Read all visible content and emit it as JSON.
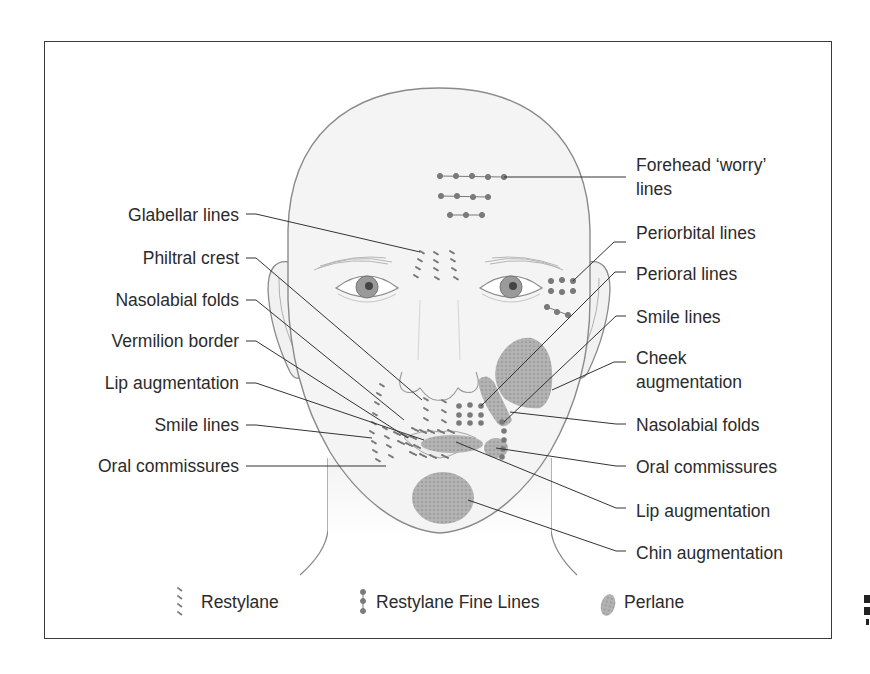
{
  "figure": {
    "left_labels": [
      {
        "id": "glabellar",
        "text": "Glabellar lines"
      },
      {
        "id": "philtral",
        "text": "Philtral crest"
      },
      {
        "id": "nasolabial-left",
        "text": "Nasolabial folds"
      },
      {
        "id": "vermilion",
        "text": "Vermilion border"
      },
      {
        "id": "lip-left",
        "text": "Lip augmentation"
      },
      {
        "id": "smile-left",
        "text": "Smile lines"
      },
      {
        "id": "oral-left",
        "text": "Oral commissures"
      }
    ],
    "right_labels": [
      {
        "id": "forehead",
        "line1": "Forehead ‘worry’",
        "line2": "lines"
      },
      {
        "id": "periorbital",
        "line1": "Periorbital lines"
      },
      {
        "id": "perioral",
        "line1": "Perioral lines"
      },
      {
        "id": "smile-right",
        "line1": "Smile lines"
      },
      {
        "id": "cheek",
        "line1": "Cheek",
        "line2": "augmentation"
      },
      {
        "id": "nasolabial-right",
        "line1": "Nasolabial folds"
      },
      {
        "id": "oral-right",
        "line1": "Oral commissures"
      },
      {
        "id": "lip-right",
        "line1": "Lip augmentation"
      },
      {
        "id": "chin",
        "line1": "Chin augmentation"
      }
    ],
    "legend": [
      {
        "id": "restylane",
        "label": "Restylane",
        "icon": "dashed-lines-icon"
      },
      {
        "id": "restylane-fine",
        "label": "Restylane Fine Lines",
        "icon": "dotted-column-icon"
      },
      {
        "id": "perlane",
        "label": "Perlane",
        "icon": "textured-blob-icon"
      }
    ],
    "colors": {
      "outline": "#8a8a8a",
      "skin": "#f4f4f4",
      "marker": "#7a7a7a",
      "perlane_fill": "#a9a9a9",
      "leader": "#333333",
      "frame": "#3a3a3a"
    }
  }
}
